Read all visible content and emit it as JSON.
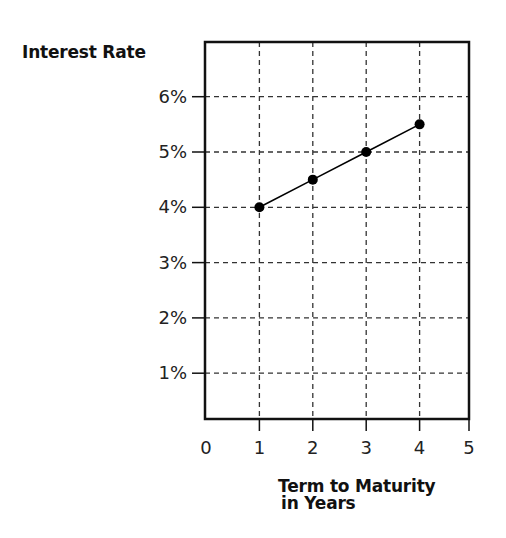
{
  "chart_data": {
    "type": "line",
    "title": "",
    "xlabel": "Term to Maturity in Years",
    "xlabel_lines": [
      "Term to Maturity",
      "in Years"
    ],
    "ylabel": "Interest Rate",
    "x": [
      1,
      2,
      3,
      4
    ],
    "series": [
      {
        "name": "Interest Rate",
        "values": [
          4.0,
          4.5,
          5.0,
          5.5
        ],
        "marker": "circle",
        "color": "#000000"
      }
    ],
    "x_ticks": [
      "0",
      "1",
      "2",
      "3",
      "4",
      "5"
    ],
    "y_ticks": [
      "1%",
      "2%",
      "3%",
      "4%",
      "5%",
      "6%"
    ],
    "xlim": [
      0,
      5
    ],
    "ylim": [
      0.15,
      6.8
    ],
    "grid": true,
    "grid_style": "dashed",
    "legend": "none"
  }
}
